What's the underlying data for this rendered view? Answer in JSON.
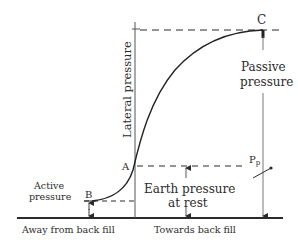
{
  "diagram": {
    "type": "earth-pressure-vs-wall-movement",
    "colors": {
      "ink": "#2b2b2b",
      "background": "#ffffff"
    },
    "axes": {
      "vertical_label": "Lateral pressure",
      "left_label": "Away from back fill",
      "right_label": "Towards back fill"
    },
    "points": {
      "A": "A",
      "B": "B",
      "C": "C"
    },
    "annotations": {
      "active_line1": "Active",
      "active_line2": "pressure",
      "passive_line1": "Passive",
      "passive_line2": "pressure",
      "rest_line1": "Earth pressure",
      "rest_line2": "at rest",
      "pp_main": "P",
      "pp_sub": "p"
    }
  }
}
